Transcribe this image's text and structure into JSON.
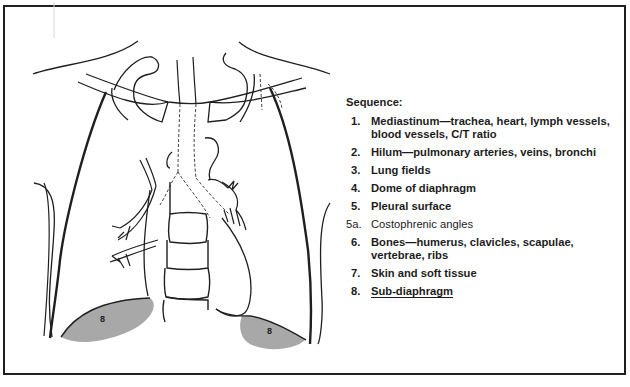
{
  "diagram": {
    "type": "chest-radiograph-schematic",
    "view": "frontal (PA) chest",
    "colors": {
      "line": "#1f1f1f",
      "shaded_region": "#a8a8a8",
      "background": "#ffffff"
    },
    "region_labels": [
      {
        "id": "sub-diaphragm-right",
        "text": "8"
      },
      {
        "id": "sub-diaphragm-left",
        "text": "8"
      }
    ]
  },
  "legend": {
    "title": "Sequence:",
    "items": [
      {
        "num": "1.",
        "text": "Mediastinum—trachea, heart, lymph vessels, blood vessels, C/T ratio"
      },
      {
        "num": "2.",
        "text": "Hilum—pulmonary arteries, veins, bronchi"
      },
      {
        "num": "3.",
        "text": "Lung fields"
      },
      {
        "num": "4.",
        "text": "Dome of diaphragm"
      },
      {
        "num": "5.",
        "text": "Pleural surface"
      },
      {
        "num": "5a.",
        "text": "Costophrenic angles"
      },
      {
        "num": "6.",
        "text": "Bones—humerus, clavicles, scapulae, vertebrae, ribs"
      },
      {
        "num": "7.",
        "text": "Skin and soft tissue"
      },
      {
        "num": "8.",
        "text": "Sub-diaphragm"
      }
    ]
  }
}
